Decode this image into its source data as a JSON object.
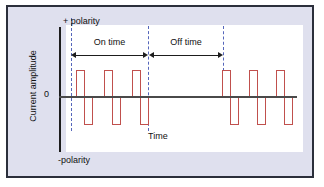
{
  "figure": {
    "title": "",
    "x_axis_label": "Time",
    "y_axis_label": "Current amplitude",
    "zero_tick": "0",
    "positive_polarity_label": "+ polarity",
    "negative_polarity_label": "-polarity",
    "on_time_label": "On time",
    "off_time_label": "Off time",
    "colors": {
      "waveform": "#c0504d",
      "panel_background": "#dfe0ee",
      "plot_background": "#ffffff",
      "panel_border": "#2b2f3b",
      "axis": "#1d1d1d",
      "zero_line": "#4a4a4a",
      "guide_line": "#5566bb"
    }
  },
  "chart_data": {
    "type": "line",
    "title": "",
    "xlabel": "Time",
    "ylabel": "Current amplitude",
    "grid": false,
    "legend": "none",
    "ylim": [
      -1,
      1
    ],
    "xlim": [
      0,
      100
    ],
    "y_tick_labels": [
      "0"
    ],
    "annotations": [
      {
        "text": "+ polarity",
        "position": "top-left"
      },
      {
        "text": "-polarity",
        "position": "bottom-left"
      },
      {
        "text": "On time",
        "position": "top-span-1"
      },
      {
        "text": "Off time",
        "position": "top-span-2"
      },
      {
        "text": "Time",
        "position": "bottom-center"
      }
    ],
    "guide_lines_x": [
      4,
      44,
      70
    ],
    "spans": [
      {
        "label": "On time",
        "x_start": 4,
        "x_end": 44
      },
      {
        "label": "Off time",
        "x_end": 70,
        "x_start": 44
      }
    ],
    "series": [
      {
        "name": "Biphasic pulsed current",
        "description": "Symmetrical biphasic rectangular pulse train with an on-time burst, an off-time interval, then a further burst.",
        "pulses": [
          {
            "x_start": 6,
            "x_width": 3,
            "amplitude": 1,
            "phase": "positive"
          },
          {
            "x_start": 9,
            "x_width": 3,
            "amplitude": -1,
            "phase": "negative"
          },
          {
            "x_start": 19,
            "x_width": 3,
            "amplitude": 1,
            "phase": "positive"
          },
          {
            "x_start": 22,
            "x_width": 3,
            "amplitude": -1,
            "phase": "negative"
          },
          {
            "x_start": 32,
            "x_width": 3,
            "amplitude": 1,
            "phase": "positive"
          },
          {
            "x_start": 35,
            "x_width": 3,
            "amplitude": -1,
            "phase": "negative"
          },
          {
            "x_start": 71,
            "x_width": 3,
            "amplitude": 1,
            "phase": "positive"
          },
          {
            "x_start": 74,
            "x_width": 3,
            "amplitude": -1,
            "phase": "negative"
          },
          {
            "x_start": 83,
            "x_width": 3,
            "amplitude": 1,
            "phase": "positive"
          },
          {
            "x_start": 86,
            "x_width": 3,
            "amplitude": -1,
            "phase": "negative"
          },
          {
            "x_start": 95,
            "x_width": 3,
            "amplitude": 1,
            "phase": "positive"
          },
          {
            "x_start": 98,
            "x_width": 3,
            "amplitude": -1,
            "phase": "negative"
          }
        ]
      }
    ]
  },
  "layout": {
    "pulse_groups_px": [
      {
        "pos_left": 68,
        "neg_left": 76
      },
      {
        "pos_left": 96,
        "neg_left": 104
      },
      {
        "pos_left": 124,
        "neg_left": 132
      },
      {
        "pos_left": 214,
        "neg_left": 222
      },
      {
        "pos_left": 241,
        "neg_left": 249
      },
      {
        "pos_left": 268,
        "neg_left": 276
      }
    ],
    "pulse_width_px": 9,
    "pulse_pos_top_px": 63,
    "pulse_pos_height_px": 27,
    "pulse_neg_top_px": 90,
    "pulse_neg_height_px": 28,
    "guides_px": [
      {
        "left": 63,
        "top": 11,
        "height": 113
      },
      {
        "left": 140,
        "top": 19,
        "height": 105
      },
      {
        "left": 215,
        "top": 19,
        "height": 45
      }
    ],
    "spans_px": [
      {
        "left": 63,
        "width": 77,
        "top": 44,
        "label_left": 63,
        "label_width": 77,
        "label_top": 30
      },
      {
        "left": 141,
        "width": 74,
        "top": 44,
        "label_left": 141,
        "label_width": 74,
        "label_top": 30
      }
    ]
  }
}
